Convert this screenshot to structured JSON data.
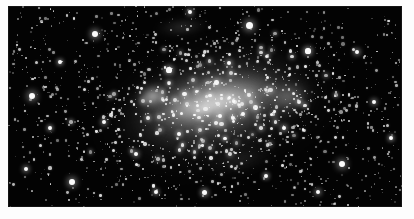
{
  "figure": {
    "kind": "astronomical-photograph",
    "palette": {
      "paper": "#ffffff",
      "sky": "#030303",
      "star": "#ffffff",
      "nebulosity": "#c8c8c8"
    },
    "plate": {
      "x": 8,
      "y": 6,
      "width": 394,
      "height": 201,
      "border_label": "white photographic margin"
    }
  },
  "chart_data": {
    "type": "scatter",
    "title": "",
    "xlabel": "",
    "ylabel": "",
    "xlim": [
      0,
      394
    ],
    "ylim": [
      0,
      201
    ],
    "grid": false,
    "legend": null,
    "annotations": [
      {
        "name": "galaxy-bar",
        "cx": 204,
        "cy": 96,
        "angle_deg": -12,
        "length": 172,
        "width": 56
      },
      {
        "name": "bright-knot-northeast",
        "cx": 147,
        "cy": 91
      },
      {
        "name": "diffuse-halo",
        "cx": 210,
        "cy": 100,
        "rx": 150,
        "ry": 82
      },
      {
        "name": "northern-wisp",
        "cx": 174,
        "cy": 21
      },
      {
        "name": "southern-wisp",
        "cx": 231,
        "cy": 154
      }
    ],
    "series": [
      {
        "name": "bright-foreground-stars",
        "points": [
          [
            24,
            90,
            3.4
          ],
          [
            87,
            28,
            3.0
          ],
          [
            241,
            19,
            3.5
          ],
          [
            334,
            158,
            3.3
          ],
          [
            300,
            45,
            2.6
          ],
          [
            64,
            176,
            2.9
          ],
          [
            349,
            46,
            2.4
          ],
          [
            18,
            163,
            2.2
          ],
          [
            96,
            116,
            2.3
          ],
          [
            196,
            186,
            2.5
          ],
          [
            276,
            122,
            2.4
          ],
          [
            161,
            64,
            2.6
          ],
          [
            366,
            96,
            2.3
          ],
          [
            128,
            148,
            2.2
          ],
          [
            221,
            57,
            2.4
          ],
          [
            52,
            56,
            2.1
          ],
          [
            310,
            186,
            2.2
          ],
          [
            182,
            6,
            2.3
          ],
          [
            258,
            170,
            2.1
          ],
          [
            148,
            186,
            2.0
          ],
          [
            383,
            132,
            2.1
          ],
          [
            42,
            122,
            2.0
          ],
          [
            212,
            110,
            2.2
          ],
          [
            171,
            128,
            2.0
          ]
        ]
      },
      {
        "name": "resolved-field-stars",
        "approx_count": 620,
        "size_range": [
          0.6,
          2.0
        ]
      },
      {
        "name": "unresolved-background-stars",
        "approx_count": 900,
        "size_range": [
          0.4,
          1.1
        ]
      }
    ]
  }
}
